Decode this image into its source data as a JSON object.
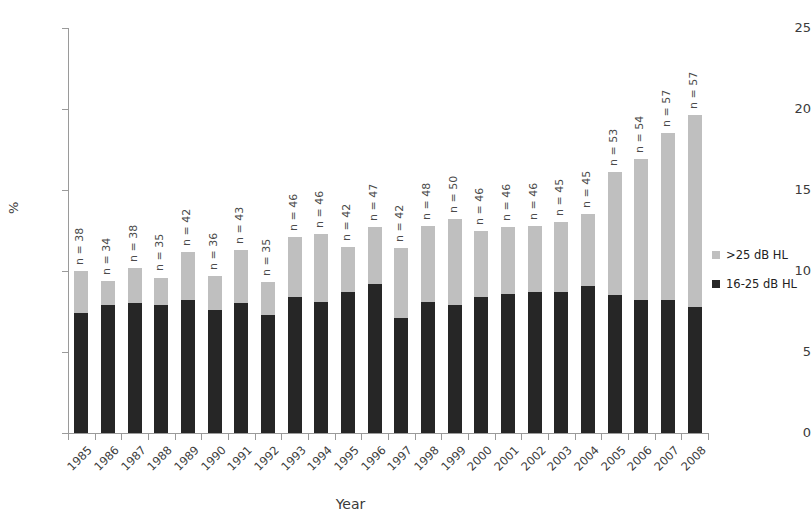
{
  "chart_data": {
    "type": "bar",
    "subtype": "stacked",
    "title": "",
    "xlabel": "Year",
    "ylabel": "%",
    "ylim": [
      0,
      25
    ],
    "yticks": [
      0,
      5,
      10,
      15,
      20,
      25
    ],
    "grid": false,
    "legend_position": "right",
    "categories": [
      "1985",
      "1986",
      "1987",
      "1988",
      "1989",
      "1990",
      "1991",
      "1992",
      "1993",
      "1994",
      "1995",
      "1996",
      "1997",
      "1998",
      "1999",
      "2000",
      "2001",
      "2002",
      "2003",
      "2004",
      "2005",
      "2006",
      "2007",
      "2008"
    ],
    "series": [
      {
        "name": "16-25 dB HL",
        "color": "#262626",
        "values": [
          7.4,
          7.9,
          8.0,
          7.9,
          8.2,
          7.6,
          8.0,
          7.3,
          8.4,
          8.1,
          8.7,
          9.2,
          7.1,
          8.1,
          7.9,
          8.4,
          8.6,
          8.7,
          8.7,
          9.1,
          8.5,
          8.2,
          8.2,
          7.8
        ]
      },
      {
        "name": ">25 dB HL",
        "color": "#bfbfbf",
        "values": [
          2.6,
          1.5,
          2.2,
          1.7,
          3.0,
          2.1,
          3.3,
          2.0,
          3.7,
          4.2,
          2.8,
          3.5,
          4.3,
          4.7,
          5.3,
          4.1,
          4.1,
          4.1,
          4.3,
          4.4,
          7.6,
          8.7,
          10.3,
          11.8
        ]
      }
    ],
    "totals": [
      10.0,
      9.4,
      10.2,
      9.6,
      11.2,
      9.7,
      11.3,
      9.3,
      12.1,
      12.3,
      11.5,
      12.7,
      11.4,
      12.8,
      13.2,
      12.5,
      12.7,
      12.8,
      13.0,
      13.5,
      16.1,
      16.9,
      18.5,
      19.6
    ],
    "annotations": [
      "n = 38",
      "n = 34",
      "n = 38",
      "n = 35",
      "n = 42",
      "n = 36",
      "n = 43",
      "n = 35",
      "n = 46",
      "n = 46",
      "n = 42",
      "n = 47",
      "n = 42",
      "n = 48",
      "n = 50",
      "n = 46",
      "n = 46",
      "n = 46",
      "n = 45",
      "n = 45",
      "n = 53",
      "n = 54",
      "n = 57",
      "n = 57"
    ],
    "sample_sizes": [
      38,
      34,
      38,
      35,
      42,
      36,
      43,
      35,
      46,
      46,
      42,
      47,
      42,
      48,
      50,
      46,
      46,
      46,
      45,
      45,
      53,
      54,
      57,
      57
    ]
  },
  "axes": {
    "y_label": "%",
    "x_label": "Year",
    "y_tick_labels": [
      "25",
      "20",
      "15",
      "10",
      "5",
      "0"
    ]
  },
  "legend": {
    "items": [
      {
        "label": ">25 dB HL",
        "color": "#bfbfbf"
      },
      {
        "label": "16-25 dB HL",
        "color": "#262626"
      }
    ]
  }
}
